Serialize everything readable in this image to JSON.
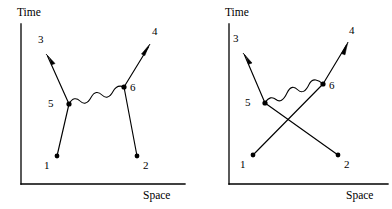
{
  "figure": {
    "background_color": "#ffffff",
    "ink_color": "#000000",
    "panel_count": 2
  },
  "panels": [
    {
      "id": "left",
      "name": "direct-diagram",
      "axes": {
        "y_label": "Time",
        "x_label": "Space",
        "origin": {
          "x": 21,
          "y": 184
        },
        "y_top": {
          "x": 21,
          "y": 24
        },
        "x_right": {
          "x": 185,
          "y": 184
        }
      },
      "vertices": [
        {
          "label": "5",
          "x": 69,
          "y": 104,
          "label_x": 48,
          "label_y": 98
        },
        {
          "label": "6",
          "x": 124,
          "y": 87,
          "label_x": 130,
          "label_y": 82
        }
      ],
      "endpoints": [
        {
          "label": "1",
          "x": 57,
          "y": 156,
          "label_x": 44,
          "label_y": 160,
          "kind": "incoming"
        },
        {
          "label": "2",
          "x": 137,
          "y": 156,
          "label_x": 143,
          "label_y": 160,
          "kind": "incoming"
        },
        {
          "label": "3",
          "x": 46,
          "y": 54,
          "label_x": 38,
          "label_y": 34,
          "kind": "outgoing"
        },
        {
          "label": "4",
          "x": 150,
          "y": 44,
          "label_x": 152,
          "label_y": 26,
          "kind": "outgoing"
        }
      ],
      "fermion_lines": [
        {
          "name": "line-1-to-5",
          "from": "1",
          "to": "5"
        },
        {
          "name": "line-5-to-3",
          "from": "5",
          "to": "3"
        },
        {
          "name": "line-2-to-6",
          "from": "2",
          "to": "6"
        },
        {
          "name": "line-6-to-4",
          "from": "6",
          "to": "4"
        }
      ],
      "photon_line": {
        "name": "photon-5-to-6",
        "from": "5",
        "to": "6",
        "wiggles": 4
      }
    },
    {
      "id": "right",
      "name": "exchange-diagram",
      "axes": {
        "y_label": "Time",
        "x_label": "Space",
        "origin": {
          "x": 33,
          "y": 184
        },
        "y_top": {
          "x": 33,
          "y": 24
        },
        "x_right": {
          "x": 192,
          "y": 184
        }
      },
      "vertices": [
        {
          "label": "5",
          "x": 69,
          "y": 103,
          "label_x": 49,
          "label_y": 97
        },
        {
          "label": "6",
          "x": 127,
          "y": 84,
          "label_x": 133,
          "label_y": 80
        }
      ],
      "endpoints": [
        {
          "label": "1",
          "x": 57,
          "y": 155,
          "label_x": 44,
          "label_y": 159,
          "kind": "incoming"
        },
        {
          "label": "2",
          "x": 142,
          "y": 155,
          "label_x": 148,
          "label_y": 159,
          "kind": "incoming"
        },
        {
          "label": "3",
          "x": 47,
          "y": 53,
          "label_x": 37,
          "label_y": 33,
          "kind": "outgoing"
        },
        {
          "label": "4",
          "x": 152,
          "y": 42,
          "label_x": 153,
          "label_y": 25,
          "kind": "outgoing"
        }
      ],
      "fermion_lines": [
        {
          "name": "line-1-to-6",
          "from": "1",
          "to": "6"
        },
        {
          "name": "line-5-to-3",
          "from": "5",
          "to": "3"
        },
        {
          "name": "line-2-to-5",
          "from": "2",
          "to": "5"
        },
        {
          "name": "line-6-to-4",
          "from": "6",
          "to": "4"
        }
      ],
      "photon_line": {
        "name": "photon-5-to-6",
        "from": "5",
        "to": "6",
        "wiggles": 4
      }
    }
  ]
}
